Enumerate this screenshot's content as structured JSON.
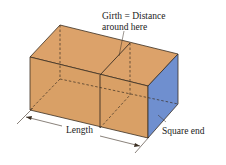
{
  "diagram": {
    "type": "box-illustration",
    "labels": {
      "girth_line1": "Girth = Distance",
      "girth_line2": "around here",
      "length": "Length",
      "square_end": "Square end"
    },
    "colors": {
      "box_face": "#d9a066",
      "box_top": "#dca26a",
      "square_end": "#6f8fcf",
      "edge": "#3a2e22",
      "background": "#ffffff"
    }
  }
}
